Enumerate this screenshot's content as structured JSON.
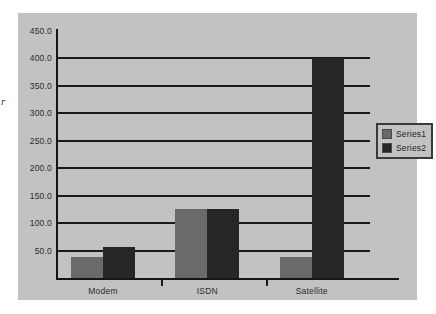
{
  "canvas": {
    "width": 436,
    "height": 314,
    "page_background": "#ffffff",
    "panel_background": "#c2c2c2"
  },
  "edge_artifact": {
    "text": "r"
  },
  "legend": {
    "position": "right",
    "entries": [
      {
        "label": "Series1",
        "color": "#6a6a6a"
      },
      {
        "label": "Series2",
        "color": "#262626"
      }
    ]
  },
  "chart_data": {
    "type": "bar",
    "title": "",
    "subtitle": "",
    "xlabel": "",
    "ylabel": "",
    "categories": [
      "Modem",
      "ISDN",
      "Satellite"
    ],
    "series": [
      {
        "name": "Series1",
        "color": "#6a6a6a",
        "values": [
          38,
          126,
          38
        ]
      },
      {
        "name": "Series2",
        "color": "#262626",
        "values": [
          57,
          126,
          400
        ]
      }
    ],
    "ylim": [
      0,
      450
    ],
    "ytick_values": [
      50,
      100,
      150,
      200,
      250,
      300,
      350,
      400,
      450
    ],
    "ytick_labels": [
      "50.0",
      "100.0",
      "150.0",
      "200.0",
      "250.0",
      "300.0",
      "350.0",
      "400.0",
      "450.0"
    ],
    "gridline_values": [
      50,
      100,
      150,
      200,
      250,
      300,
      350,
      400
    ],
    "grid": true,
    "grid_color": "#1a1a1a",
    "axis_color": "#141414",
    "legend_position": "right",
    "bar_mode": "grouped"
  }
}
